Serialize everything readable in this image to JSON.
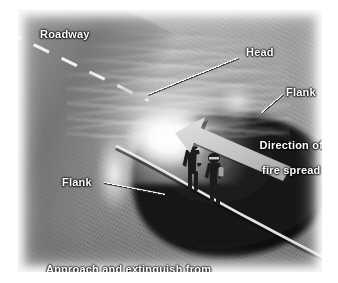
{
  "figure": {
    "kind": "wildland-fire-attack-diagram",
    "media": "grayscale photographic illustration",
    "palette": {
      "page_background": "#ffffff",
      "terrain_light": "#b7b7b7",
      "terrain_mid": "#8d8d8d",
      "terrain_dark": "#6f6f6f",
      "burned_area": "#141414",
      "smoke_white": "#ffffff",
      "label_text": "#ffffff",
      "label_outline": "#000000",
      "arrow_fill": "#c9c9c9",
      "arrow_shadow": "#2a2a2a",
      "roadway_stripe": "#f2f2f2"
    }
  },
  "labels": {
    "roadway": "Roadway",
    "head": "Head",
    "flank_right": "Flank",
    "flank_left": "Flank",
    "direction_line1": "Direction of",
    "direction_line2": "fire spread"
  },
  "caption": {
    "line1": "Approach and extinguish from",
    "line2": "burned side of fire area"
  },
  "scene": {
    "roadway": {
      "description": "Two-lane roadway crossing the upper-left corner",
      "centerline": "dashed white stripe"
    },
    "fire": {
      "head_description": "Advancing head of the fire with tall smoke and flame plume",
      "flank_right_description": "Right flank of the fire",
      "flank_left_description": "Left flank of the fire",
      "burned_area_description": "Blackened burned-over area behind the fire"
    },
    "crew": {
      "count": 2,
      "description": "Two firefighters advancing a hose line from the burned side"
    },
    "arrow": {
      "semantic": "direction-of-fire-spread-arrow",
      "points_toward": "upper-left"
    }
  }
}
